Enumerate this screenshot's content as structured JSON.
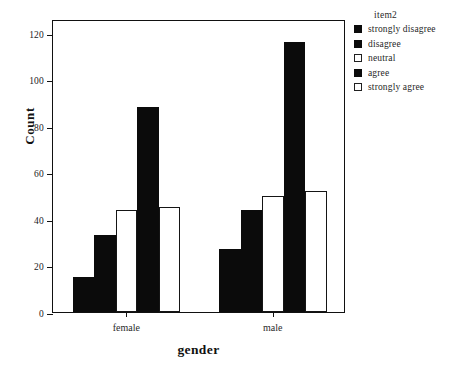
{
  "chart_data": {
    "type": "bar",
    "title": "",
    "xlabel": "gender",
    "ylabel": "Count",
    "categories": [
      "female",
      "male"
    ],
    "legend_title": "item2",
    "legend_position": "right",
    "grid": false,
    "ylim": [
      0,
      126
    ],
    "yticks": [
      0,
      20,
      40,
      60,
      80,
      100,
      120
    ],
    "ytick_labels": [
      "0",
      "20",
      "40",
      "60",
      "80",
      "100",
      "120"
    ],
    "series": [
      {
        "name": "strongly disagree",
        "fill": "solid",
        "values": [
          15,
          27
        ]
      },
      {
        "name": "disagree",
        "fill": "solid",
        "values": [
          33,
          44
        ]
      },
      {
        "name": "neutral",
        "fill": "open",
        "values": [
          44,
          50
        ]
      },
      {
        "name": "agree",
        "fill": "solid",
        "values": [
          88,
          116
        ]
      },
      {
        "name": "strongly agree",
        "fill": "open",
        "values": [
          45,
          52
        ]
      }
    ],
    "colors": {
      "solid": "#0b0b0b",
      "open": "#ffffff",
      "outline": "#151515",
      "axis": "#111111",
      "background": "#ffffff"
    }
  }
}
